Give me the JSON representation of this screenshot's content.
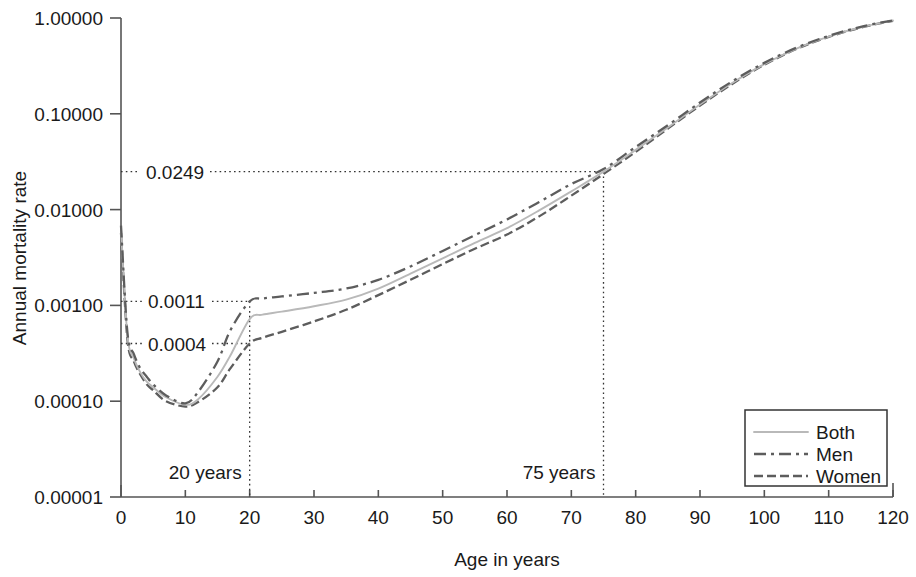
{
  "chart_data": {
    "type": "line",
    "title": "",
    "xlabel": "Age in years",
    "ylabel": "Annual mortality rate",
    "yscale": "log",
    "xlim": [
      0,
      120
    ],
    "ylim": [
      1e-05,
      1.0
    ],
    "grid": false,
    "legend_position": "bottom-right",
    "x_ticks": [
      "0",
      "10",
      "20",
      "30",
      "40",
      "50",
      "60",
      "70",
      "80",
      "90",
      "100",
      "110",
      "120"
    ],
    "y_ticks": [
      "1.00000",
      "0.10000",
      "0.01000",
      "0.00100",
      "0.00010",
      "0.00001"
    ],
    "y_tick_values": [
      1.0,
      0.1,
      0.01,
      0.001,
      0.0001,
      1e-05
    ],
    "x": [
      0,
      1,
      2,
      3,
      4,
      5,
      7,
      10,
      12,
      15,
      17,
      20,
      22,
      25,
      30,
      35,
      40,
      45,
      50,
      55,
      60,
      65,
      70,
      75,
      80,
      85,
      90,
      95,
      100,
      105,
      110,
      115,
      120
    ],
    "series": [
      {
        "name": "Both",
        "style": "solid",
        "color": "#b9b9b9",
        "values": [
          0.0062,
          0.00048,
          0.00028,
          0.0002,
          0.00016,
          0.00014,
          0.00011,
          9.2e-05,
          0.000105,
          0.00018,
          0.0003,
          0.00072,
          0.0008,
          0.00086,
          0.00098,
          0.00115,
          0.0015,
          0.00215,
          0.0031,
          0.0045,
          0.0064,
          0.0098,
          0.0155,
          0.0249,
          0.042,
          0.072,
          0.125,
          0.21,
          0.33,
          0.48,
          0.64,
          0.8,
          0.94
        ]
      },
      {
        "name": "Men",
        "style": "dash-dot",
        "color": "#5d5d5d",
        "values": [
          0.0068,
          0.00052,
          0.00031,
          0.00022,
          0.00018,
          0.00015,
          0.000115,
          9.5e-05,
          0.000125,
          0.00026,
          0.00055,
          0.0011,
          0.00118,
          0.00124,
          0.00135,
          0.0015,
          0.00185,
          0.00255,
          0.0037,
          0.0054,
          0.0079,
          0.012,
          0.0185,
          0.0265,
          0.045,
          0.076,
          0.131,
          0.218,
          0.34,
          0.49,
          0.65,
          0.81,
          0.945
        ]
      },
      {
        "name": "Women",
        "style": "dashed",
        "color": "#5d5d5d",
        "values": [
          0.0057,
          0.00044,
          0.00026,
          0.00019,
          0.00015,
          0.00013,
          0.0001,
          8.8e-05,
          9.8e-05,
          0.00014,
          0.00022,
          0.0004,
          0.00046,
          0.00053,
          0.00068,
          0.0009,
          0.00128,
          0.00185,
          0.0027,
          0.0039,
          0.0055,
          0.0085,
          0.014,
          0.0235,
          0.04,
          0.07,
          0.122,
          0.205,
          0.325,
          0.475,
          0.635,
          0.795,
          0.935
        ]
      }
    ],
    "annotations": [
      {
        "label": "0.0249",
        "value": 0.0249,
        "at_age": 75,
        "kind": "y-callout"
      },
      {
        "label": "0.0011",
        "value": 0.0011,
        "at_age": 20,
        "kind": "y-callout"
      },
      {
        "label": "0.0004",
        "value": 0.0004,
        "at_age": 20,
        "kind": "y-callout"
      },
      {
        "label": "20 years",
        "value": 20,
        "kind": "x-callout"
      },
      {
        "label": "75 years",
        "value": 75,
        "kind": "x-callout"
      }
    ]
  },
  "legend": {
    "items": [
      {
        "label": "Both"
      },
      {
        "label": "Men"
      },
      {
        "label": "Women"
      }
    ]
  },
  "axes": {
    "x_title": "Age in years",
    "y_title": "Annual mortality rate"
  }
}
